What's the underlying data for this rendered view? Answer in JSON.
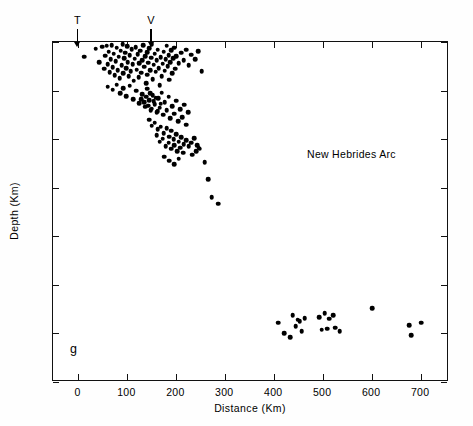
{
  "figure": {
    "panel_label": "g",
    "region_label": "New Hebrides Arc"
  },
  "markers": [
    {
      "id": "trench",
      "letter": "T",
      "distance_km": 0
    },
    {
      "id": "volcanic-front",
      "letter": "V",
      "distance_km": 150
    }
  ],
  "chart_data": {
    "type": "scatter",
    "title": "New Hebrides Arc",
    "xlabel": "Distance (Km)",
    "ylabel": "Depth (Km)",
    "xlim": [
      -52,
      757
    ],
    "ylim": [
      0,
      700
    ],
    "y_inverted": true,
    "grid": false,
    "legend": "none",
    "xticks": [
      0,
      100,
      200,
      300,
      400,
      500,
      600,
      700
    ],
    "yticks": [
      0,
      100,
      200,
      300,
      400,
      500,
      600,
      700
    ],
    "xticklabels": [
      "0",
      "100",
      "200",
      "300",
      "400",
      "500",
      "600",
      "700"
    ],
    "yticklabels": [
      "0",
      "100",
      "200",
      "300",
      "400",
      "500",
      "600",
      "700"
    ],
    "annotations": [
      {
        "text": "New Hebrides Arc",
        "x": 520,
        "y": 225
      },
      {
        "text": "g",
        "x": -12,
        "y": 637
      },
      {
        "text": "T",
        "x": 0,
        "y": -38
      },
      {
        "text": "V",
        "x": 150,
        "y": -38
      }
    ],
    "series": [
      {
        "name": "New Hebrides Arc hypocenters",
        "marker": "filled-circle",
        "color": "#000000",
        "points": [
          [
            12,
            30
          ],
          [
            35,
            14
          ],
          [
            42,
            42
          ],
          [
            49,
            10
          ],
          [
            52,
            55
          ],
          [
            55,
            28
          ],
          [
            58,
            8
          ],
          [
            60,
            46
          ],
          [
            62,
            20
          ],
          [
            64,
            62
          ],
          [
            66,
            35
          ],
          [
            68,
            6
          ],
          [
            70,
            52
          ],
          [
            72,
            24
          ],
          [
            74,
            68
          ],
          [
            76,
            40
          ],
          [
            78,
            12
          ],
          [
            80,
            58
          ],
          [
            82,
            30
          ],
          [
            84,
            75
          ],
          [
            86,
            18
          ],
          [
            88,
            48
          ],
          [
            90,
            5
          ],
          [
            92,
            64
          ],
          [
            94,
            33
          ],
          [
            96,
            22
          ],
          [
            98,
            54
          ],
          [
            100,
            9
          ],
          [
            101,
            41
          ],
          [
            103,
            70
          ],
          [
            105,
            27
          ],
          [
            107,
            60
          ],
          [
            109,
            15
          ],
          [
            111,
            46
          ],
          [
            113,
            80
          ],
          [
            115,
            34
          ],
          [
            117,
            11
          ],
          [
            119,
            57
          ],
          [
            121,
            25
          ],
          [
            123,
            72
          ],
          [
            124,
            44
          ],
          [
            126,
            18
          ],
          [
            128,
            63
          ],
          [
            130,
            37
          ],
          [
            132,
            7
          ],
          [
            134,
            51
          ],
          [
            136,
            29
          ],
          [
            138,
            85
          ],
          [
            140,
            21
          ],
          [
            141,
            67
          ],
          [
            143,
            43
          ],
          [
            145,
            13
          ],
          [
            147,
            58
          ],
          [
            149,
            32
          ],
          [
            150,
            4
          ],
          [
            152,
            76
          ],
          [
            154,
            47
          ],
          [
            156,
            24
          ],
          [
            158,
            61
          ],
          [
            160,
            38
          ],
          [
            162,
            16
          ],
          [
            164,
            54
          ],
          [
            166,
            89
          ],
          [
            168,
            31
          ],
          [
            170,
            70
          ],
          [
            172,
            45
          ],
          [
            174,
            20
          ],
          [
            176,
            59
          ],
          [
            178,
            36
          ],
          [
            180,
            8
          ],
          [
            182,
            50
          ],
          [
            184,
            27
          ],
          [
            186,
            78
          ],
          [
            188,
            42
          ],
          [
            190,
            17
          ],
          [
            192,
            64
          ],
          [
            194,
            33
          ],
          [
            196,
            12
          ],
          [
            198,
            55
          ],
          [
            200,
            29
          ],
          [
            205,
            44
          ],
          [
            210,
            22
          ],
          [
            215,
            37
          ],
          [
            220,
            16
          ],
          [
            225,
            48
          ],
          [
            230,
            26
          ],
          [
            238,
            35
          ],
          [
            245,
            19
          ],
          [
            252,
            60
          ],
          [
            60,
            92
          ],
          [
            70,
            98
          ],
          [
            78,
            88
          ],
          [
            85,
            105
          ],
          [
            92,
            95
          ],
          [
            98,
            112
          ],
          [
            105,
            90
          ],
          [
            112,
            118
          ],
          [
            118,
            100
          ],
          [
            124,
            126
          ],
          [
            130,
            108
          ],
          [
            136,
            133
          ],
          [
            140,
            96
          ],
          [
            144,
            120
          ],
          [
            148,
            140
          ],
          [
            152,
            110
          ],
          [
            156,
            128
          ],
          [
            160,
            145
          ],
          [
            163,
            116
          ],
          [
            166,
            135
          ],
          [
            170,
            104
          ],
          [
            173,
            150
          ],
          [
            176,
            124
          ],
          [
            180,
            141
          ],
          [
            184,
            113
          ],
          [
            188,
            157
          ],
          [
            192,
            132
          ],
          [
            196,
            148
          ],
          [
            200,
            121
          ],
          [
            204,
            163
          ],
          [
            208,
            138
          ],
          [
            212,
            155
          ],
          [
            216,
            129
          ],
          [
            220,
            170
          ],
          [
            224,
            145
          ],
          [
            128,
            118
          ],
          [
            134,
            124
          ],
          [
            138,
            113
          ],
          [
            142,
            131
          ],
          [
            146,
            106
          ],
          [
            150,
            137
          ],
          [
            154,
            122
          ],
          [
            158,
            115
          ],
          [
            162,
            142
          ],
          [
            168,
            127
          ],
          [
            144,
            160
          ],
          [
            150,
            172
          ],
          [
            156,
            166
          ],
          [
            162,
            180
          ],
          [
            168,
            174
          ],
          [
            174,
            188
          ],
          [
            180,
            178
          ],
          [
            186,
            195
          ],
          [
            190,
            183
          ],
          [
            195,
            200
          ],
          [
            200,
            190
          ],
          [
            205,
            205
          ],
          [
            210,
            196
          ],
          [
            215,
            210
          ],
          [
            220,
            202
          ],
          [
            225,
            215
          ],
          [
            230,
            207
          ],
          [
            236,
            198
          ],
          [
            242,
            212
          ],
          [
            248,
            220
          ],
          [
            160,
            192
          ],
          [
            166,
            205
          ],
          [
            172,
            199
          ],
          [
            178,
            214
          ],
          [
            184,
            207
          ],
          [
            190,
            220
          ],
          [
            196,
            212
          ],
          [
            202,
            225
          ],
          [
            208,
            218
          ],
          [
            214,
            228
          ],
          [
            175,
            236
          ],
          [
            185,
            244
          ],
          [
            196,
            252
          ],
          [
            205,
            240
          ],
          [
            232,
            232
          ],
          [
            240,
            225
          ],
          [
            246,
            218
          ],
          [
            258,
            248
          ],
          [
            265,
            282
          ],
          [
            272,
            320
          ],
          [
            285,
            333
          ],
          [
            408,
            578
          ],
          [
            420,
            600
          ],
          [
            432,
            608
          ],
          [
            438,
            563
          ],
          [
            444,
            585
          ],
          [
            448,
            572
          ],
          [
            452,
            575
          ],
          [
            456,
            596
          ],
          [
            462,
            569
          ],
          [
            492,
            566
          ],
          [
            503,
            558
          ],
          [
            512,
            570
          ],
          [
            520,
            563
          ],
          [
            497,
            592
          ],
          [
            508,
            590
          ],
          [
            524,
            588
          ],
          [
            534,
            596
          ],
          [
            600,
            548
          ],
          [
            676,
            583
          ],
          [
            680,
            604
          ],
          [
            700,
            578
          ]
        ]
      }
    ]
  }
}
